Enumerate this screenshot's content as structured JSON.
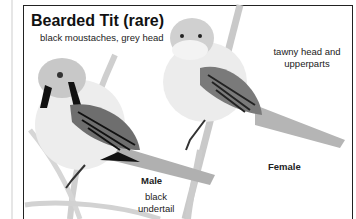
{
  "title": "Bearded Tit (rare)",
  "labels": {
    "male_head": "black moustaches, grey head",
    "female_head_line1": "tawny head and",
    "female_head_line2": "upperparts",
    "male": "Male",
    "male_tail_line1": "black",
    "male_tail_line2": "undertail",
    "female": "Female"
  }
}
